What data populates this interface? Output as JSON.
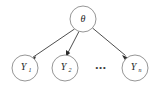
{
  "diagram": {
    "type": "directed-graphical-model",
    "background_color": "#ffffff",
    "node_stroke_color": "#8a8a8a",
    "edge_color": "#3a3a3a",
    "text_color": "#262626",
    "parent": {
      "id": "theta",
      "label": "θ",
      "subscript": "",
      "cx": 83,
      "cy": 19,
      "r": 13
    },
    "children": [
      {
        "id": "y1",
        "label": "Y",
        "subscript": "1",
        "cx": 25,
        "cy": 68,
        "r": 13
      },
      {
        "id": "y2",
        "label": "Y",
        "subscript": "2",
        "cx": 65,
        "cy": 68,
        "r": 13
      },
      {
        "id": "yn",
        "label": "Y",
        "subscript": "n",
        "cx": 135,
        "cy": 68,
        "r": 13
      }
    ],
    "ellipsis": {
      "text": "•••",
      "cx": 101,
      "cy": 69
    },
    "edges": [
      {
        "from": "theta",
        "to": "y1"
      },
      {
        "from": "theta",
        "to": "y2"
      },
      {
        "from": "theta",
        "to": "yn"
      }
    ]
  }
}
